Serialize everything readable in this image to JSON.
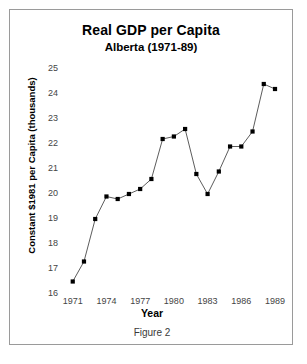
{
  "chart_data": {
    "type": "line",
    "title": "Real GDP per Capita",
    "subtitle": "Alberta (1971-89)",
    "caption": "Figure 2",
    "xlabel": "Year",
    "ylabel": "Constant $1981 per Capita (thousands)",
    "xlim": [
      1970.4,
      1989.8
    ],
    "ylim": [
      16,
      25
    ],
    "grid": false,
    "legend": false,
    "marker": "square",
    "marker_color": "#000000",
    "line_color": "#4a4a4a",
    "ytick_labels": [
      "25",
      "24",
      "23",
      "22",
      "21",
      "20",
      "19",
      "18",
      "17",
      "16"
    ],
    "ytick_values": [
      25,
      24,
      23,
      22,
      21,
      20,
      19,
      18,
      17,
      16
    ],
    "xtick_labels": [
      "1971",
      "1974",
      "1977",
      "1980",
      "1983",
      "1986",
      "1989"
    ],
    "xtick_values": [
      1971,
      1974,
      1977,
      1980,
      1983,
      1986,
      1989
    ],
    "x": [
      1971,
      1972,
      1973,
      1974,
      1975,
      1976,
      1977,
      1978,
      1979,
      1980,
      1981,
      1982,
      1983,
      1984,
      1985,
      1986,
      1987,
      1988,
      1989
    ],
    "values": [
      16.5,
      17.3,
      19.0,
      19.9,
      19.8,
      20.0,
      20.2,
      20.6,
      22.2,
      22.3,
      22.6,
      20.8,
      20.0,
      20.9,
      21.9,
      21.9,
      22.5,
      24.4,
      24.2
    ],
    "series": [
      {
        "name": "Real GDP per Capita",
        "values": [
          16.5,
          17.3,
          19.0,
          19.9,
          19.8,
          20.0,
          20.2,
          20.6,
          22.2,
          22.3,
          22.6,
          20.8,
          20.0,
          20.9,
          21.9,
          21.9,
          22.5,
          24.4,
          24.2
        ]
      }
    ]
  }
}
